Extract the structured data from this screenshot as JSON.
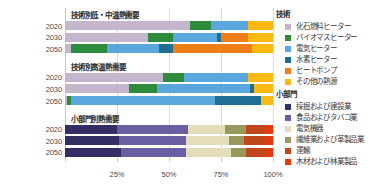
{
  "chart_data": {
    "type": "bar",
    "orientation": "horizontal",
    "stacked": true,
    "normalized_percent": true,
    "title": "",
    "xlabel": "",
    "ylabel": "",
    "xlim": [
      0,
      100
    ],
    "xticks": [
      0,
      25,
      50,
      75,
      100
    ],
    "xtick_labels": [
      "",
      "25%",
      "50%",
      "75%",
      "100%"
    ],
    "grid": true,
    "legend_position": "right",
    "panels": [
      {
        "title": "技術別低・中温熱需要",
        "categories": [
          "2020",
          "2030",
          "2050"
        ],
        "series": [
          {
            "name": "化石燃料ヒーター",
            "color": "#c5b5cd",
            "values": [
              60,
              40,
              3
            ]
          },
          {
            "name": "バイオマスヒーター",
            "color": "#2e8b3c",
            "values": [
              10,
              12,
              17
            ]
          },
          {
            "name": "電気ヒーター",
            "color": "#5aa7dd",
            "values": [
              18,
              21,
              25
            ]
          },
          {
            "name": "水素ヒーター",
            "color": "#1f6e94",
            "values": [
              0,
              2,
              7
            ]
          },
          {
            "name": "ヒートポンプ",
            "color": "#f07d17",
            "values": [
              0,
              13,
              38
            ]
          },
          {
            "name": "その他の熱源",
            "color": "#fcb913",
            "values": [
              12,
              12,
              10
            ]
          }
        ]
      },
      {
        "title": "技術別高温熱需要",
        "categories": [
          "2020",
          "2030",
          "2050"
        ],
        "series": [
          {
            "name": "化石燃料ヒーター",
            "color": "#c5b5cd",
            "values": [
              47,
              31,
              1
            ]
          },
          {
            "name": "バイオマスヒーター",
            "color": "#2e8b3c",
            "values": [
              10,
              13,
              2
            ]
          },
          {
            "name": "電気ヒーター",
            "color": "#5aa7dd",
            "values": [
              31,
              45,
              69
            ]
          },
          {
            "name": "水素ヒーター",
            "color": "#1f6e94",
            "values": [
              0,
              2,
              22
            ]
          },
          {
            "name": "ヒートポンプ",
            "color": "#f07d17",
            "values": [
              0,
              0,
              0
            ]
          },
          {
            "name": "その他の熱源",
            "color": "#fcb913",
            "values": [
              12,
              9,
              6
            ]
          }
        ]
      },
      {
        "title": "小部門別熱需要",
        "categories": [
          "2020",
          "2030",
          "2050"
        ],
        "series": [
          {
            "name": "採掘および建設業",
            "color": "#332e63",
            "values": [
              25,
              26,
              27
            ]
          },
          {
            "name": "食品およびタバコ業",
            "color": "#6a5fa3",
            "values": [
              34,
              32,
              31
            ]
          },
          {
            "name": "電気機器",
            "color": "#e3ddb8",
            "values": [
              18,
              21,
              22
            ]
          },
          {
            "name": "繊維業および革製品業",
            "color": "#97985c",
            "values": [
              10,
              7,
              7
            ]
          },
          {
            "name": "運輸",
            "color": "#c0471c",
            "values": [
              9,
              10,
              9
            ]
          },
          {
            "name": "木材および林業製品",
            "color": "#e8380d",
            "values": [
              4,
              4,
              4
            ]
          }
        ]
      }
    ]
  },
  "legends": [
    {
      "title": "技術",
      "items": [
        {
          "label": "化石燃料ヒーター",
          "color": "#c5b5cd"
        },
        {
          "label": "バイオマスヒーター",
          "color": "#2e8b3c"
        },
        {
          "label": "電気ヒーター",
          "color": "#5aa7dd"
        },
        {
          "label": "水素ヒーター",
          "color": "#1f6e94"
        },
        {
          "label": "ヒートポンプ",
          "color": "#f07d17"
        },
        {
          "label": "その他の熱源",
          "color": "#fcb913"
        }
      ]
    },
    {
      "title": "小部門",
      "items": [
        {
          "label": "採掘および建設業",
          "color": "#332e63"
        },
        {
          "label": "食品およびタバコ業",
          "color": "#6a5fa3"
        },
        {
          "label": "電気機器",
          "color": "#e3ddb8"
        },
        {
          "label": "繊維業および革製品業",
          "color": "#97985c"
        },
        {
          "label": "運輸",
          "color": "#c0471c"
        },
        {
          "label": "木材および林業製品",
          "color": "#e8380d"
        }
      ]
    }
  ]
}
